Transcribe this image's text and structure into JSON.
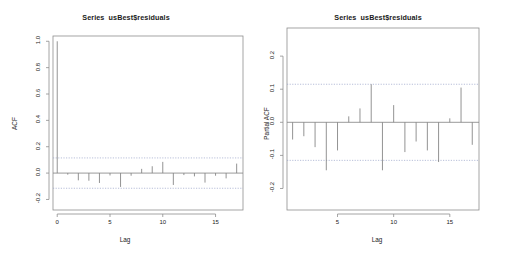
{
  "figure": {
    "background": "#ffffff",
    "axis_color": "#8e8e8e",
    "spike_color": "#808080",
    "conf_color": "#9aa3c8",
    "text_color": "#1a1a1a"
  },
  "panels": {
    "acf": {
      "title": "Series  usBest$residuals",
      "ylabel": "ACF",
      "xlabel": "Lag"
    },
    "pacf": {
      "title": "Series  usBest$residuals",
      "ylabel": "Partial ACF",
      "xlabel": "Lag"
    }
  },
  "chart_data": [
    {
      "type": "bar",
      "id": "acf",
      "title": "Series  usBest$residuals",
      "xlabel": "Lag",
      "ylabel": "ACF",
      "xlim": [
        -0.4,
        17.6
      ],
      "ylim": [
        -0.28,
        1.04
      ],
      "xticks": [
        0,
        5,
        10,
        15
      ],
      "xtick_labels": [
        "0",
        "5",
        "10",
        "15"
      ],
      "yticks": [
        -0.2,
        0.0,
        0.2,
        0.4,
        0.6,
        0.8,
        1.0
      ],
      "ytick_labels": [
        "-0.2",
        "0.0",
        "0.2",
        "0.4",
        "0.6",
        "0.8",
        "1.0"
      ],
      "grid": false,
      "legend": "none",
      "zero_line": 0.0,
      "confidence_bands": [
        0.115,
        -0.115
      ],
      "confidence_style": "dashed",
      "x": [
        0,
        1,
        2,
        3,
        4,
        5,
        6,
        7,
        8,
        9,
        10,
        11,
        12,
        13,
        14,
        15,
        16,
        17
      ],
      "values": [
        1.0,
        -0.012,
        -0.055,
        -0.058,
        -0.075,
        -0.018,
        -0.105,
        -0.02,
        0.032,
        0.052,
        0.085,
        -0.09,
        -0.015,
        -0.025,
        -0.072,
        -0.02,
        -0.04,
        0.072
      ]
    },
    {
      "type": "bar",
      "id": "pacf",
      "title": "Series  usBest$residuals",
      "xlabel": "Lag",
      "ylabel": "Partial ACF",
      "xlim": [
        0.5,
        17.6
      ],
      "ylim": [
        -0.265,
        0.285
      ],
      "xticks": [
        5,
        10,
        15
      ],
      "xtick_labels": [
        "5",
        "10",
        "15"
      ],
      "yticks": [
        -0.2,
        -0.1,
        0.0,
        0.1,
        0.2
      ],
      "ytick_labels": [
        "-0.2",
        "-0.1",
        "0.0",
        "0.1",
        "0.2"
      ],
      "grid": false,
      "legend": "none",
      "zero_line": 0.0,
      "confidence_bands": [
        0.115,
        -0.115
      ],
      "confidence_style": "dashed",
      "x": [
        1,
        2,
        3,
        4,
        5,
        6,
        7,
        8,
        9,
        10,
        11,
        12,
        13,
        14,
        15,
        16,
        17
      ],
      "values": [
        -0.052,
        -0.042,
        -0.075,
        -0.145,
        -0.085,
        0.018,
        0.042,
        0.115,
        -0.145,
        0.052,
        -0.09,
        -0.058,
        -0.085,
        -0.12,
        0.012,
        0.105,
        -0.068
      ]
    }
  ]
}
